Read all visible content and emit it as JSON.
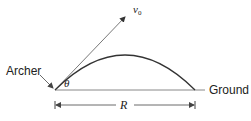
{
  "diagram": {
    "labels": {
      "archer": "Archer",
      "ground": "Ground",
      "velocity": "v",
      "velocity_subscript": "0",
      "angle": "θ",
      "range": "R"
    },
    "colors": {
      "line": "#333333",
      "ground": "#888888",
      "text": "#222222"
    }
  }
}
